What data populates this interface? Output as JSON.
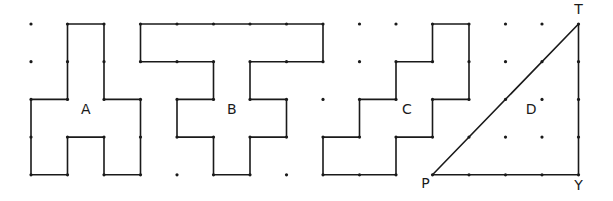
{
  "grid": {
    "origin_x": 31,
    "origin_y": 24,
    "dx": 36.5,
    "dy": 37.7,
    "cols": 16,
    "rows": 5
  },
  "shapes": [
    {
      "label": "A",
      "label_pos": [
        1.5,
        2.4
      ],
      "vertices": [
        [
          1,
          0
        ],
        [
          2,
          0
        ],
        [
          2,
          2
        ],
        [
          3,
          2
        ],
        [
          3,
          4
        ],
        [
          2,
          4
        ],
        [
          2,
          3
        ],
        [
          1,
          3
        ],
        [
          1,
          4
        ],
        [
          0,
          4
        ],
        [
          0,
          2
        ],
        [
          1,
          2
        ]
      ]
    },
    {
      "label": "B",
      "label_pos": [
        5.5,
        2.4
      ],
      "vertices": [
        [
          3,
          0
        ],
        [
          8,
          0
        ],
        [
          8,
          1
        ],
        [
          6,
          1
        ],
        [
          6,
          2
        ],
        [
          7,
          2
        ],
        [
          7,
          3
        ],
        [
          6,
          3
        ],
        [
          6,
          4
        ],
        [
          5,
          4
        ],
        [
          5,
          3
        ],
        [
          4,
          3
        ],
        [
          4,
          2
        ],
        [
          5,
          2
        ],
        [
          5,
          1
        ],
        [
          3,
          1
        ]
      ]
    },
    {
      "label": "C",
      "label_pos": [
        10.3,
        2.4
      ],
      "vertices": [
        [
          11,
          0
        ],
        [
          12,
          0
        ],
        [
          12,
          2
        ],
        [
          11,
          2
        ],
        [
          11,
          3
        ],
        [
          10,
          3
        ],
        [
          10,
          4
        ],
        [
          8,
          4
        ],
        [
          8,
          3
        ],
        [
          9,
          3
        ],
        [
          9,
          2
        ],
        [
          10,
          2
        ],
        [
          10,
          1
        ],
        [
          11,
          1
        ]
      ]
    },
    {
      "label": "D",
      "label_pos": [
        13.7,
        2.4
      ],
      "vertices": [
        [
          11,
          4
        ],
        [
          15,
          0
        ],
        [
          15,
          4
        ]
      ]
    }
  ],
  "vertex_labels": [
    {
      "text": "T",
      "at": [
        15,
        0
      ],
      "offset": [
        0,
        -10
      ]
    },
    {
      "text": "P",
      "at": [
        11,
        4
      ],
      "offset": [
        -7,
        13
      ]
    },
    {
      "text": "Y",
      "at": [
        15,
        4
      ],
      "offset": [
        0,
        15
      ]
    }
  ],
  "dots": [
    [
      0,
      0
    ],
    [
      0,
      1
    ],
    [
      0,
      2
    ],
    [
      0,
      3
    ],
    [
      0,
      4
    ],
    [
      1,
      0
    ],
    [
      1,
      1
    ],
    [
      1,
      2
    ],
    [
      1,
      3
    ],
    [
      1,
      4
    ],
    [
      2,
      0
    ],
    [
      2,
      1
    ],
    [
      2,
      2
    ],
    [
      2,
      3
    ],
    [
      2,
      4
    ],
    [
      3,
      0
    ],
    [
      3,
      1
    ],
    [
      3,
      2
    ],
    [
      3,
      3
    ],
    [
      3,
      4
    ],
    [
      4,
      0
    ],
    [
      4,
      1
    ],
    [
      4,
      2
    ],
    [
      4,
      3
    ],
    [
      4,
      4
    ],
    [
      5,
      0
    ],
    [
      5,
      1
    ],
    [
      5,
      2
    ],
    [
      5,
      3
    ],
    [
      5,
      4
    ],
    [
      6,
      0
    ],
    [
      6,
      1
    ],
    [
      6,
      2
    ],
    [
      6,
      3
    ],
    [
      6,
      4
    ],
    [
      7,
      0
    ],
    [
      7,
      1
    ],
    [
      7,
      2
    ],
    [
      7,
      3
    ],
    [
      7,
      4
    ],
    [
      8,
      0
    ],
    [
      8,
      1
    ],
    [
      8,
      2
    ],
    [
      8,
      3
    ],
    [
      8,
      4
    ],
    [
      9,
      0
    ],
    [
      9,
      1
    ],
    [
      9,
      2
    ],
    [
      9,
      3
    ],
    [
      9,
      4
    ],
    [
      10,
      0
    ],
    [
      10,
      1
    ],
    [
      10,
      2
    ],
    [
      10,
      3
    ],
    [
      10,
      4
    ],
    [
      11,
      0
    ],
    [
      11,
      1
    ],
    [
      11,
      2
    ],
    [
      11,
      3
    ],
    [
      11,
      4
    ],
    [
      12,
      0
    ],
    [
      12,
      1
    ],
    [
      12,
      2
    ],
    [
      12,
      3
    ],
    [
      12,
      4
    ],
    [
      13,
      0
    ],
    [
      13,
      1
    ],
    [
      13,
      2
    ],
    [
      13,
      3
    ],
    [
      13,
      4
    ],
    [
      14,
      0
    ],
    [
      14,
      1
    ],
    [
      14,
      2
    ],
    [
      14,
      3
    ],
    [
      14,
      4
    ],
    [
      15,
      0
    ],
    [
      15,
      1
    ],
    [
      15,
      2
    ],
    [
      15,
      3
    ],
    [
      15,
      4
    ]
  ],
  "hidden_dots": [
    [
      1,
      1
    ],
    [
      1,
      2
    ],
    [
      4,
      1
    ],
    [
      4,
      2
    ],
    [
      4,
      3
    ],
    [
      5,
      2
    ],
    [
      5,
      3
    ],
    [
      6,
      2
    ],
    [
      6,
      3
    ],
    [
      7,
      1
    ],
    [
      9,
      3
    ],
    [
      9,
      4
    ],
    [
      10,
      2
    ],
    [
      10,
      3
    ],
    [
      11,
      1
    ],
    [
      11,
      2
    ],
    [
      11,
      3
    ],
    [
      12,
      3
    ],
    [
      12,
      4
    ],
    [
      13,
      4
    ],
    [
      14,
      1
    ],
    [
      1,
      3
    ],
    [
      2,
      3
    ],
    [
      2,
      2
    ]
  ]
}
